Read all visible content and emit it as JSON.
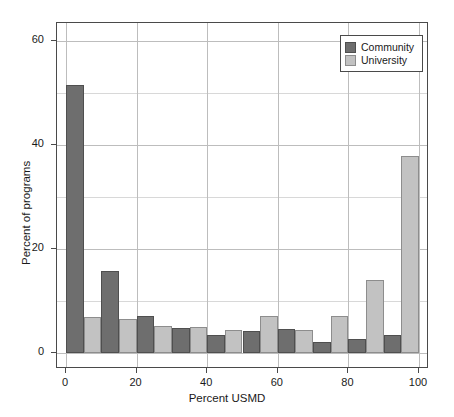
{
  "chart_data": {
    "type": "bar",
    "title": "",
    "subtitle": "",
    "xlabel": "Percent USMD",
    "ylabel": "Percent of programs",
    "xlim": [
      0,
      100
    ],
    "ylim": [
      0,
      63
    ],
    "xticks": [
      "0",
      "20",
      "40",
      "60",
      "80",
      "100"
    ],
    "xtick_values": [
      0,
      20,
      40,
      60,
      80,
      100
    ],
    "yticks": [
      "0",
      "20",
      "40",
      "60"
    ],
    "ytick_values": [
      0,
      20,
      40,
      60
    ],
    "grid": true,
    "grid_axis": "both",
    "legend_position": "top-right",
    "bin_edges": [
      0,
      10,
      20,
      30,
      40,
      50,
      60,
      70,
      80,
      90,
      100
    ],
    "categories": [
      "0-10",
      "10-20",
      "20-30",
      "30-40",
      "40-50",
      "50-60",
      "60-70",
      "70-80",
      "80-90",
      "90-100"
    ],
    "series": [
      {
        "name": "Community",
        "color": "#6e6e6e",
        "values": [
          51.5,
          15.8,
          7.2,
          4.8,
          3.4,
          4.2,
          4.6,
          2.1,
          2.6,
          3.4
        ]
      },
      {
        "name": "University",
        "color": "#c2c2c2",
        "values": [
          7.0,
          6.5,
          5.2,
          5.0,
          4.4,
          7.2,
          4.4,
          7.2,
          14.0,
          37.9
        ]
      }
    ]
  },
  "legend": {
    "items": [
      {
        "label": "Community",
        "color": "#6e6e6e"
      },
      {
        "label": "University",
        "color": "#c2c2c2"
      }
    ]
  },
  "axes": {
    "x_title": "Percent USMD",
    "y_title": "Percent of programs"
  }
}
